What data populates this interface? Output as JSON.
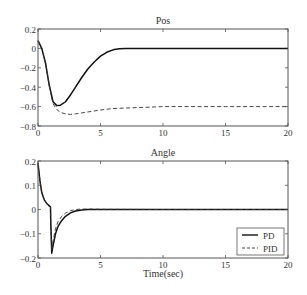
{
  "chart_data": [
    {
      "type": "line",
      "title": "Pos",
      "xlabel": "",
      "ylabel": "",
      "xlim": [
        0,
        20
      ],
      "ylim": [
        -0.8,
        0.2
      ],
      "xticks": [
        "0",
        "5",
        "10",
        "15",
        "20"
      ],
      "yticks": [
        "0.2",
        "0",
        "-0.2",
        "-0.4",
        "-0.6",
        "-0.8"
      ],
      "grid": false,
      "series": [
        {
          "name": "PD",
          "style": "solid",
          "x": [
            0,
            0.3,
            0.6,
            0.9,
            1.2,
            1.5,
            1.8,
            2.2,
            2.6,
            3.0,
            3.5,
            4.0,
            4.5,
            5.0,
            5.5,
            6.0,
            6.5,
            7.0,
            8.0,
            10,
            15,
            20
          ],
          "y": [
            0.08,
            0.0,
            -0.15,
            -0.38,
            -0.55,
            -0.59,
            -0.585,
            -0.55,
            -0.48,
            -0.4,
            -0.3,
            -0.21,
            -0.14,
            -0.08,
            -0.04,
            -0.015,
            -0.004,
            0.0,
            0.0,
            0.0,
            0.0,
            0.0
          ]
        },
        {
          "name": "PID",
          "style": "dashed",
          "x": [
            0,
            0.3,
            0.6,
            0.9,
            1.2,
            1.5,
            1.8,
            2.2,
            2.6,
            3.0,
            4.0,
            5.0,
            6.0,
            8.0,
            10,
            12,
            15,
            20
          ],
          "y": [
            0.08,
            0.0,
            -0.15,
            -0.38,
            -0.57,
            -0.63,
            -0.66,
            -0.675,
            -0.68,
            -0.675,
            -0.655,
            -0.635,
            -0.62,
            -0.61,
            -0.6,
            -0.6,
            -0.6,
            -0.6
          ]
        }
      ]
    },
    {
      "type": "line",
      "title": "Angle",
      "xlabel": "Time(sec)",
      "ylabel": "",
      "xlim": [
        0,
        20
      ],
      "ylim": [
        -0.2,
        0.2
      ],
      "xticks": [
        "0",
        "5",
        "10",
        "15",
        "20"
      ],
      "yticks": [
        "0.2",
        "0.1",
        "0",
        "-0.1",
        "-0.2"
      ],
      "grid": false,
      "legend": {
        "position": "lower right",
        "entries": [
          "PD",
          "PID"
        ]
      },
      "series": [
        {
          "name": "PD",
          "style": "solid",
          "x": [
            0,
            0.15,
            0.3,
            0.5,
            0.7,
            0.9,
            1.0,
            1.02,
            1.1,
            1.2,
            1.4,
            1.6,
            1.9,
            2.2,
            2.6,
            3.0,
            3.5,
            4.0,
            5.0,
            10,
            15,
            20
          ],
          "y": [
            0.19,
            0.12,
            0.07,
            0.04,
            0.025,
            0.015,
            0.01,
            -0.05,
            -0.18,
            -0.15,
            -0.1,
            -0.07,
            -0.045,
            -0.028,
            -0.014,
            -0.006,
            -0.002,
            0.0,
            0.0,
            0.0,
            0.0,
            0.0
          ]
        },
        {
          "name": "PID",
          "style": "dashed",
          "x": [
            0,
            0.15,
            0.3,
            0.5,
            0.7,
            0.9,
            1.0,
            1.02,
            1.1,
            1.2,
            1.4,
            1.6,
            1.9,
            2.2,
            2.6,
            3.0,
            3.5,
            4.0,
            5.0,
            10,
            15,
            20
          ],
          "y": [
            0.19,
            0.12,
            0.07,
            0.04,
            0.025,
            0.015,
            0.01,
            -0.05,
            -0.17,
            -0.13,
            -0.08,
            -0.05,
            -0.028,
            -0.015,
            -0.005,
            0.0,
            0.002,
            0.002,
            0.001,
            0.0,
            0.0,
            0.0
          ]
        }
      ]
    }
  ],
  "colors": {
    "PD": "#111111",
    "PID": "#333333",
    "axes": "#555555"
  }
}
